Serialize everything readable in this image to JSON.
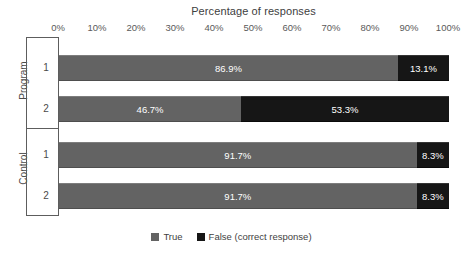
{
  "chart_data": {
    "type": "bar",
    "subtype": "stacked-horizontal-100pct-grouped",
    "title": "Percentage of responses",
    "xlabel": "",
    "ylabel": "",
    "xlim": [
      0,
      100
    ],
    "xticks": [
      "0%",
      "10%",
      "20%",
      "30%",
      "40%",
      "50%",
      "60%",
      "70%",
      "80%",
      "90%",
      "100%"
    ],
    "xtick_values": [
      0,
      10,
      20,
      30,
      40,
      50,
      60,
      70,
      80,
      90,
      100
    ],
    "grid": false,
    "legend_position": "bottom",
    "categories": [
      "1",
      "2",
      "1",
      "2"
    ],
    "groups": [
      {
        "name": "Program",
        "categories": [
          "1",
          "2"
        ]
      },
      {
        "name": "Control",
        "categories": [
          "1",
          "2"
        ]
      }
    ],
    "series": [
      {
        "name": "True",
        "color": "#636363",
        "values": [
          86.9,
          46.7,
          91.7,
          91.7
        ]
      },
      {
        "name": "False (correct response)",
        "color": "#161616",
        "values": [
          13.1,
          53.3,
          8.3,
          8.3
        ]
      }
    ],
    "bars": [
      {
        "group": "Program",
        "category": "1",
        "segments": [
          {
            "series": "True",
            "value": 86.9,
            "label": "86.9%"
          },
          {
            "series": "False (correct response)",
            "value": 13.1,
            "label": "13.1%"
          }
        ]
      },
      {
        "group": "Program",
        "category": "2",
        "segments": [
          {
            "series": "True",
            "value": 46.7,
            "label": "46.7%"
          },
          {
            "series": "False (correct response)",
            "value": 53.3,
            "label": "53.3%"
          }
        ]
      },
      {
        "group": "Control",
        "category": "1",
        "segments": [
          {
            "series": "True",
            "value": 91.7,
            "label": "91.7%"
          },
          {
            "series": "False (correct response)",
            "value": 8.3,
            "label": "8.3%"
          }
        ]
      },
      {
        "group": "Control",
        "category": "2",
        "segments": [
          {
            "series": "True",
            "value": 91.7,
            "label": "91.7%"
          },
          {
            "series": "False (correct response)",
            "value": 8.3,
            "label": "8.3%"
          }
        ]
      }
    ],
    "legend": [
      {
        "label": "True",
        "color": "#636363"
      },
      {
        "label": "False (correct response)",
        "color": "#161616"
      }
    ]
  },
  "colors": {
    "true_series": "#636363",
    "false_series": "#161616",
    "axis": "#5d5d5d",
    "text": "#3f3f3f",
    "background": "#ffffff"
  }
}
